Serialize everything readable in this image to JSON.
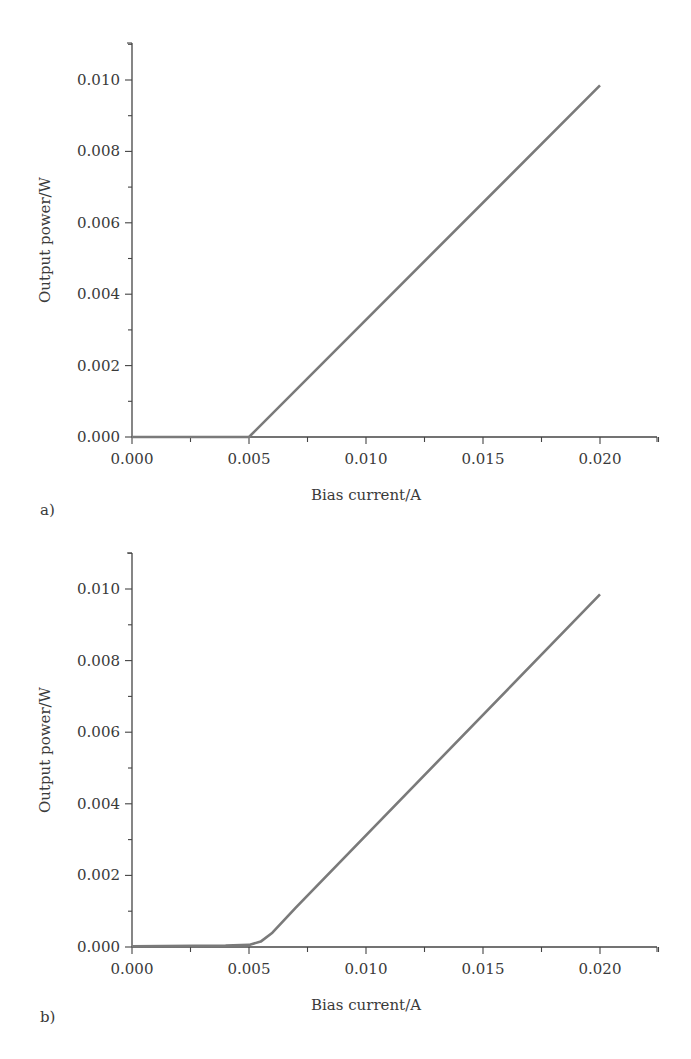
{
  "chart_data": [
    {
      "type": "line",
      "panel_label": "a)",
      "title": "",
      "xlabel": "Bias current/A",
      "ylabel": "Output power/W",
      "xlim": [
        0,
        0.0225
      ],
      "ylim": [
        0,
        0.0111
      ],
      "xticks": [
        "0.000",
        "0.005",
        "0.010",
        "0.015",
        "0.020"
      ],
      "yticks": [
        "0.000",
        "0.002",
        "0.004",
        "0.006",
        "0.008",
        "0.010"
      ],
      "grid": false,
      "legend": null,
      "series": [
        {
          "name": "output power",
          "x": [
            0.0,
            0.005,
            0.02
          ],
          "y": [
            0.0,
            0.0,
            0.00985
          ]
        }
      ]
    },
    {
      "type": "line",
      "panel_label": "b)",
      "title": "",
      "xlabel": "Bias current/A",
      "ylabel": "Output power/W",
      "xlim": [
        0,
        0.0225
      ],
      "ylim": [
        0,
        0.0111
      ],
      "xticks": [
        "0.000",
        "0.005",
        "0.010",
        "0.015",
        "0.020"
      ],
      "yticks": [
        "0.000",
        "0.002",
        "0.004",
        "0.006",
        "0.008",
        "0.010"
      ],
      "grid": false,
      "legend": null,
      "series": [
        {
          "name": "output power",
          "x": [
            0.0,
            0.004,
            0.005,
            0.0055,
            0.006,
            0.007,
            0.02
          ],
          "y": [
            2e-05,
            4e-05,
            6e-05,
            0.00015,
            0.0004,
            0.0011,
            0.00985
          ]
        }
      ]
    }
  ]
}
